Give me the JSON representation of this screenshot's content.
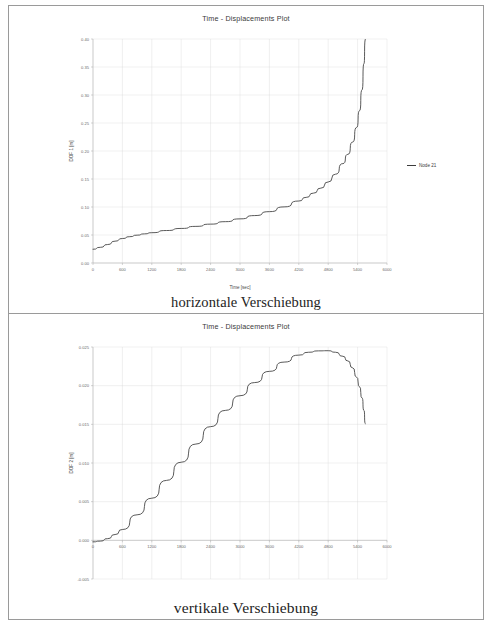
{
  "page": {
    "figures": [
      {
        "caption": "horizontale Verschiebung",
        "chart_title": "Time - Displacements Plot",
        "legend_label": "Node 21"
      },
      {
        "caption": "vertikale Verschiebung",
        "chart_title": "Time - Displacements Plot",
        "legend_label": "Node 21"
      }
    ]
  },
  "chart_data": [
    {
      "type": "line",
      "title": "Time - Displacements Plot",
      "xlabel": "Time [sec]",
      "ylabel": "DOF 1 [m]",
      "xlim": [
        0,
        6000
      ],
      "ylim": [
        0.0,
        0.4
      ],
      "xticks": [
        0,
        600,
        1200,
        1800,
        2400,
        3000,
        3600,
        4200,
        4800,
        5400,
        6000
      ],
      "xtick_labels": [
        "0",
        "600",
        "1200",
        "1800",
        "2400",
        "3000",
        "3600",
        "4200",
        "4800",
        "5400",
        "6000"
      ],
      "yticks": [
        0.0,
        0.05,
        0.1,
        0.15,
        0.2,
        0.25,
        0.3,
        0.35,
        0.4
      ],
      "ytick_labels": [
        "0.00",
        "0.05",
        "0.10",
        "0.15",
        "0.20",
        "0.25",
        "0.30",
        "0.35",
        "0.40"
      ],
      "grid": true,
      "legend_position": "right",
      "series": [
        {
          "name": "Node 21",
          "color": "#3c3c3c",
          "x": [
            0,
            150,
            300,
            450,
            600,
            750,
            900,
            1050,
            1200,
            1500,
            1800,
            2100,
            2400,
            2700,
            3000,
            3300,
            3600,
            3900,
            4200,
            4350,
            4500,
            4650,
            4800,
            4950,
            5100,
            5200,
            5300,
            5380,
            5440,
            5490,
            5530,
            5555
          ],
          "y": [
            0.0245,
            0.028,
            0.033,
            0.039,
            0.0437,
            0.047,
            0.0497,
            0.052,
            0.0541,
            0.058,
            0.0617,
            0.0654,
            0.0694,
            0.0738,
            0.0788,
            0.0847,
            0.0917,
            0.1002,
            0.1107,
            0.1172,
            0.1248,
            0.1337,
            0.1447,
            0.1586,
            0.1775,
            0.194,
            0.216,
            0.242,
            0.272,
            0.309,
            0.356,
            0.4
          ]
        }
      ]
    },
    {
      "type": "line",
      "title": "Time - Displacements Plot",
      "xlabel": "Time [sec]",
      "ylabel": "DOF 2 [m]",
      "xlim": [
        0,
        6000
      ],
      "ylim": [
        -0.005,
        0.025
      ],
      "xticks": [
        0,
        600,
        1200,
        1800,
        2400,
        3000,
        3600,
        4200,
        4800,
        5400,
        6000
      ],
      "xtick_labels": [
        "0",
        "600",
        "1200",
        "1800",
        "2400",
        "3000",
        "3600",
        "4200",
        "4800",
        "5400",
        "6000"
      ],
      "yticks": [
        -0.005,
        0.0,
        0.005,
        0.01,
        0.015,
        0.02,
        0.025
      ],
      "ytick_labels": [
        "-0.005",
        "0.000",
        "0.005",
        "0.010",
        "0.015",
        "0.020",
        "0.025"
      ],
      "grid": true,
      "legend_position": "right",
      "series": [
        {
          "name": "Node 21",
          "color": "#3c3c3c",
          "x": [
            0,
            150,
            300,
            450,
            600,
            900,
            1200,
            1500,
            1800,
            2100,
            2400,
            2700,
            3000,
            3300,
            3600,
            3900,
            4200,
            4400,
            4600,
            4800,
            4950,
            5100,
            5200,
            5300,
            5380,
            5440,
            5490,
            5530,
            5555
          ],
          "y": [
            -0.0002,
            -0.0001,
            0.00022,
            0.00075,
            0.0014,
            0.0033,
            0.00545,
            0.00775,
            0.0101,
            0.01245,
            0.0147,
            0.0168,
            0.0187,
            0.0204,
            0.02185,
            0.02305,
            0.02395,
            0.02432,
            0.0245,
            0.02452,
            0.02432,
            0.0238,
            0.0232,
            0.0223,
            0.0211,
            0.01985,
            0.0184,
            0.0168,
            0.01505
          ]
        }
      ]
    }
  ]
}
